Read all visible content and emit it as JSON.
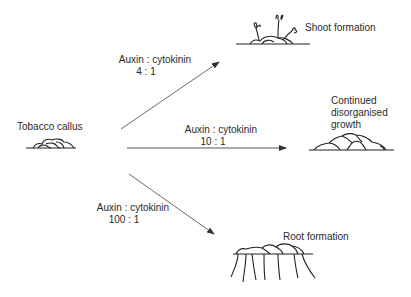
{
  "diagram": {
    "source": {
      "label": "Tobacco callus"
    },
    "branches": [
      {
        "ratio_label": "Auxin : cytokinin",
        "ratio_value": "4 : 1",
        "outcome": "Shoot formation"
      },
      {
        "ratio_label": "Auxin : cytokinin",
        "ratio_value": "10 : 1",
        "outcome_lines": [
          "Continued",
          "disorganised",
          "growth"
        ]
      },
      {
        "ratio_label": "Auxin : cytokinin",
        "ratio_value": "100 : 1",
        "outcome": "Root formation"
      }
    ],
    "colors": {
      "line": "#333333",
      "text": "#2a2a2a"
    }
  }
}
